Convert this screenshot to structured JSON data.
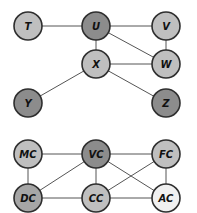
{
  "colors": {
    "light": "#bfbfbf",
    "dark": "#8c8c8c",
    "medium": "#a6a6a6",
    "pale": "#f0f0f0",
    "edge": "#555555",
    "outline": "#2e2e2e"
  },
  "graphs": [
    {
      "name": "graph-top",
      "nodes": [
        {
          "id": "T",
          "label": "T",
          "x": 28,
          "y": 26,
          "shade": "light"
        },
        {
          "id": "U",
          "label": "U",
          "x": 96,
          "y": 26,
          "shade": "dark"
        },
        {
          "id": "V",
          "label": "V",
          "x": 166,
          "y": 26,
          "shade": "light"
        },
        {
          "id": "X",
          "label": "X",
          "x": 96,
          "y": 64,
          "shade": "light"
        },
        {
          "id": "W",
          "label": "W",
          "x": 166,
          "y": 64,
          "shade": "light"
        },
        {
          "id": "Y",
          "label": "Y",
          "x": 28,
          "y": 103,
          "shade": "dark"
        },
        {
          "id": "Z",
          "label": "Z",
          "x": 166,
          "y": 103,
          "shade": "dark"
        }
      ],
      "edges": [
        [
          "T",
          "U"
        ],
        [
          "U",
          "V"
        ],
        [
          "U",
          "X"
        ],
        [
          "U",
          "W"
        ],
        [
          "V",
          "W"
        ],
        [
          "X",
          "W"
        ],
        [
          "X",
          "Y"
        ],
        [
          "X",
          "Z"
        ]
      ]
    },
    {
      "name": "graph-bottom",
      "nodes": [
        {
          "id": "MC",
          "label": "MC",
          "x": 28,
          "y": 154,
          "shade": "light"
        },
        {
          "id": "VC",
          "label": "VC",
          "x": 96,
          "y": 154,
          "shade": "dark"
        },
        {
          "id": "FC",
          "label": "FC",
          "x": 166,
          "y": 154,
          "shade": "light"
        },
        {
          "id": "DC",
          "label": "DC",
          "x": 28,
          "y": 198,
          "shade": "medium"
        },
        {
          "id": "CC",
          "label": "CC",
          "x": 96,
          "y": 198,
          "shade": "light"
        },
        {
          "id": "AC",
          "label": "AC",
          "x": 166,
          "y": 198,
          "shade": "pale"
        }
      ],
      "edges": [
        [
          "MC",
          "VC"
        ],
        [
          "VC",
          "FC"
        ],
        [
          "MC",
          "DC"
        ],
        [
          "VC",
          "DC"
        ],
        [
          "VC",
          "CC"
        ],
        [
          "VC",
          "AC"
        ],
        [
          "FC",
          "CC"
        ],
        [
          "FC",
          "AC"
        ],
        [
          "DC",
          "CC"
        ],
        [
          "CC",
          "AC"
        ]
      ]
    }
  ],
  "node_radius": 14
}
